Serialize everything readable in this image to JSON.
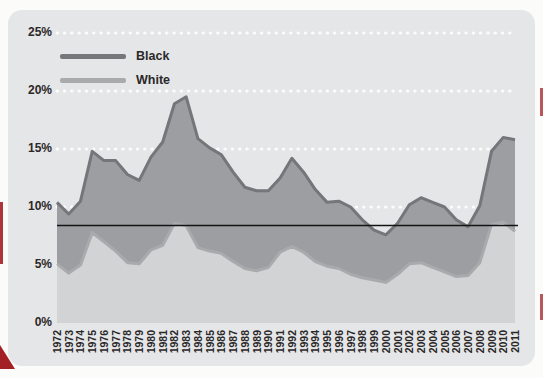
{
  "figure": {
    "background": "#fbfbfa",
    "panel_color": "#e5e6e7",
    "accent_red": "#a32025"
  },
  "legend": {
    "position": "top-left",
    "items": [
      {
        "label": "Black",
        "swatch_color": "#76777b"
      },
      {
        "label": "White",
        "swatch_color": "#a8aaac"
      }
    ]
  },
  "chart_data": {
    "type": "area",
    "title": "",
    "xlabel": "",
    "ylabel": "",
    "x": [
      "1972",
      "1973",
      "1974",
      "1975",
      "1976",
      "1977",
      "1978",
      "1979",
      "1980",
      "1981",
      "1982",
      "1983",
      "1984",
      "1985",
      "1986",
      "1987",
      "1988",
      "1989",
      "1990",
      "1991",
      "1992",
      "1993",
      "1994",
      "1995",
      "1996",
      "1997",
      "1998",
      "1999",
      "2000",
      "2001",
      "2002",
      "2003",
      "2004",
      "2005",
      "2006",
      "2007",
      "2008",
      "2009",
      "2010",
      "2011"
    ],
    "series": [
      {
        "name": "Black",
        "fill": "#9c9ea1",
        "stroke": "#747679",
        "values": [
          10.4,
          9.4,
          10.5,
          14.8,
          14.0,
          14.0,
          12.8,
          12.3,
          14.3,
          15.6,
          18.9,
          19.5,
          15.9,
          15.1,
          14.5,
          13.0,
          11.7,
          11.4,
          11.4,
          12.5,
          14.2,
          13.0,
          11.5,
          10.4,
          10.5,
          10.0,
          8.9,
          8.0,
          7.6,
          8.6,
          10.2,
          10.8,
          10.4,
          10.0,
          8.9,
          8.3,
          10.1,
          14.8,
          16.0,
          15.8
        ]
      },
      {
        "name": "White",
        "fill": "#d2d3d5",
        "stroke": "#a8aaac",
        "values": [
          5.1,
          4.3,
          5.0,
          7.8,
          7.0,
          6.2,
          5.2,
          5.1,
          6.3,
          6.7,
          8.6,
          8.4,
          6.5,
          6.2,
          6.0,
          5.3,
          4.7,
          4.5,
          4.8,
          6.1,
          6.6,
          6.1,
          5.3,
          4.9,
          4.7,
          4.2,
          3.9,
          3.7,
          3.5,
          4.2,
          5.1,
          5.2,
          4.8,
          4.4,
          4.0,
          4.1,
          5.2,
          8.5,
          8.7,
          7.9
        ]
      }
    ],
    "ylim": [
      0,
      25
    ],
    "yticks": [
      "0%",
      "5%",
      "10%",
      "15%",
      "20%",
      "25%"
    ],
    "gridline_values": [
      5,
      10,
      15,
      20,
      25
    ],
    "gridline_style": "white-dotted",
    "reference_line": {
      "value": 8.4,
      "color": "#141414"
    },
    "legend_position": "top-left",
    "grid": true
  }
}
